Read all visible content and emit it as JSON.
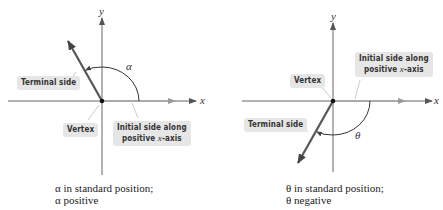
{
  "left_figure": {
    "axis_x": "x",
    "axis_y": "y",
    "angle_symbol": "α",
    "labels": {
      "terminal_side": "Terminal side",
      "vertex": "Vertex",
      "initial_side_line1": "Initial side along",
      "initial_side_line2_prefix": "positive ",
      "initial_side_line2_var": "x",
      "initial_side_line2_suffix": "-axis"
    },
    "caption_line1": "α in standard position;",
    "caption_line2": "α positive"
  },
  "right_figure": {
    "axis_x": "x",
    "axis_y": "y",
    "angle_symbol": "θ",
    "labels": {
      "terminal_side": "Terminal side",
      "vertex": "Vertex",
      "initial_side_line1": "Initial side along",
      "initial_side_line2_prefix": "positive ",
      "initial_side_line2_var": "x",
      "initial_side_line2_suffix": "-axis"
    },
    "caption_line1": "θ in standard position;",
    "caption_line2": "θ negative"
  }
}
